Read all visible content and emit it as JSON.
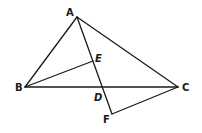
{
  "diagram": {
    "type": "geometry-figure",
    "points": {
      "A": {
        "label": "A",
        "x": 77,
        "y": 17
      },
      "B": {
        "label": "B",
        "x": 25,
        "y": 87
      },
      "C": {
        "label": "C",
        "x": 178,
        "y": 87
      },
      "D": {
        "label": "D",
        "x": 102,
        "y": 87
      },
      "E": {
        "label": "E",
        "x": 93,
        "y": 61
      },
      "F": {
        "label": "F",
        "x": 112,
        "y": 114
      }
    },
    "segments": [
      "AB",
      "AC",
      "BC",
      "AF",
      "BE",
      "CF"
    ],
    "labels": {
      "A": "A",
      "B": "B",
      "C": "C",
      "D": "D",
      "E": "E",
      "F": "F"
    },
    "stroke_color": "#1a1a1a",
    "background": "#ffffff"
  }
}
